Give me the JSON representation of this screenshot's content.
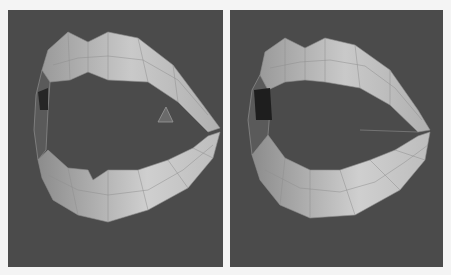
{
  "figure": {
    "panels": [
      {
        "id": "left",
        "subject": "lip-mesh-with-stray-triangle"
      },
      {
        "id": "right",
        "subject": "lip-mesh-closed-corners"
      }
    ]
  },
  "colors": {
    "background": "#4b4b4b",
    "page": "#f4f4f4",
    "lip_light": "#c8c8c8",
    "lip_mid": "#a5a5a5",
    "lip_dark": "#2a2a2a",
    "wire": "#8f8f8f"
  }
}
